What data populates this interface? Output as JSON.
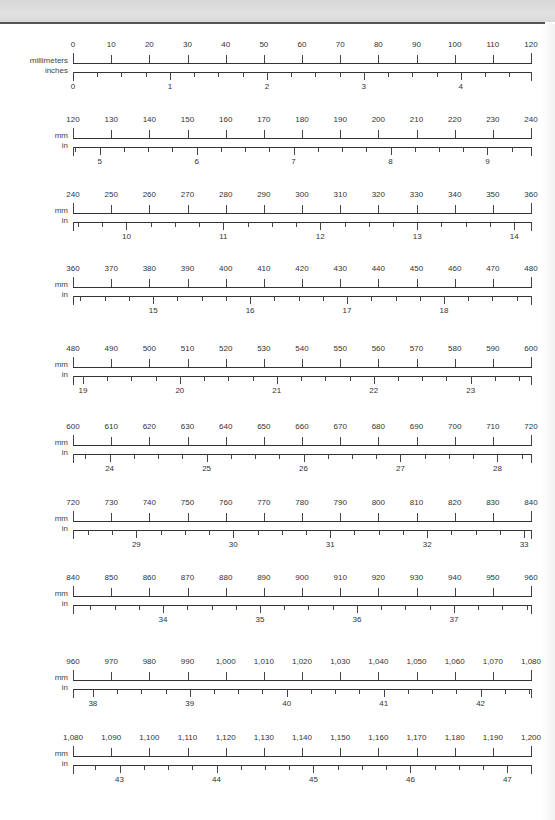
{
  "page": {
    "header_band_color": "#dcdcdc",
    "rule_color": "#555555"
  },
  "scale": {
    "x_start_px": 73,
    "x_end_px": 531,
    "mm_per_row": 120,
    "mm_major_step": 10,
    "inch_minor_step": 0.25
  },
  "rows": [
    {
      "mm_label": "millimeters",
      "in_label": "inches",
      "top": 40,
      "mm_ticks": [
        "0",
        "10",
        "20",
        "30",
        "40",
        "50",
        "60",
        "70",
        "80",
        "90",
        "100",
        "110",
        "120"
      ],
      "in_numbers": [
        "0",
        "1",
        "2",
        "3",
        "4"
      ],
      "mm_start": 0
    },
    {
      "mm_label": "mm",
      "in_label": "in",
      "top": 115,
      "mm_ticks": [
        "120",
        "130",
        "140",
        "150",
        "160",
        "170",
        "180",
        "190",
        "200",
        "210",
        "220",
        "230",
        "240"
      ],
      "in_numbers": [
        "5",
        "6",
        "7",
        "8",
        "9"
      ],
      "mm_start": 120
    },
    {
      "mm_label": "mm",
      "in_label": "in",
      "top": 190,
      "mm_ticks": [
        "240",
        "250",
        "260",
        "270",
        "280",
        "290",
        "300",
        "310",
        "320",
        "330",
        "340",
        "350",
        "360"
      ],
      "in_numbers": [
        "10",
        "11",
        "12",
        "13",
        "14"
      ],
      "mm_start": 240
    },
    {
      "mm_label": "mm",
      "in_label": "in",
      "top": 264,
      "mm_ticks": [
        "360",
        "370",
        "380",
        "390",
        "400",
        "410",
        "420",
        "430",
        "440",
        "450",
        "460",
        "470",
        "480"
      ],
      "in_numbers": [
        "15",
        "16",
        "17",
        "18"
      ],
      "mm_start": 360
    },
    {
      "mm_label": "mm",
      "in_label": "in",
      "top": 344,
      "mm_ticks": [
        "480",
        "490",
        "500",
        "510",
        "520",
        "530",
        "540",
        "550",
        "560",
        "570",
        "580",
        "590",
        "600"
      ],
      "in_numbers": [
        "19",
        "20",
        "21",
        "22",
        "23"
      ],
      "mm_start": 480
    },
    {
      "mm_label": "mm",
      "in_label": "in",
      "top": 422,
      "mm_ticks": [
        "600",
        "610",
        "620",
        "630",
        "640",
        "650",
        "660",
        "670",
        "680",
        "690",
        "700",
        "710",
        "720"
      ],
      "in_numbers": [
        "24",
        "25",
        "26",
        "27",
        "28"
      ],
      "mm_start": 600
    },
    {
      "mm_label": "mm",
      "in_label": "in",
      "top": 498,
      "mm_ticks": [
        "720",
        "730",
        "740",
        "750",
        "760",
        "770",
        "780",
        "790",
        "800",
        "810",
        "820",
        "830",
        "840"
      ],
      "in_numbers": [
        "29",
        "30",
        "31",
        "32",
        "33"
      ],
      "mm_start": 720
    },
    {
      "mm_label": "mm",
      "in_label": "in",
      "top": 573,
      "mm_ticks": [
        "840",
        "850",
        "860",
        "870",
        "880",
        "890",
        "900",
        "910",
        "920",
        "930",
        "940",
        "950",
        "960"
      ],
      "in_numbers": [
        "34",
        "35",
        "36",
        "37"
      ],
      "mm_start": 840
    },
    {
      "mm_label": "mm",
      "in_label": "in",
      "top": 657,
      "mm_ticks": [
        "960",
        "970",
        "980",
        "990",
        "1,000",
        "1,010",
        "1,020",
        "1,030",
        "1,040",
        "1,050",
        "1,060",
        "1,070",
        "1,080"
      ],
      "in_numbers": [
        "38",
        "39",
        "40",
        "41",
        "42"
      ],
      "mm_start": 960
    },
    {
      "mm_label": "mm",
      "in_label": "in",
      "top": 733,
      "mm_ticks": [
        "1,080",
        "1,090",
        "1,100",
        "1,110",
        "1,120",
        "1,130",
        "1,140",
        "1,150",
        "1,160",
        "1,170",
        "1,180",
        "1,190",
        "1,200"
      ],
      "in_numbers": [
        "43",
        "44",
        "45",
        "46",
        "47"
      ],
      "mm_start": 1080
    }
  ]
}
